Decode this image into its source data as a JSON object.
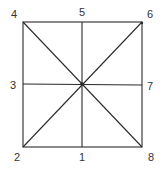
{
  "diagram": {
    "type": "square-with-diagonals-and-midlines",
    "colors": {
      "line": "#2a2a2a",
      "label": "#333333",
      "background": "#ffffff"
    },
    "square": {
      "x1": 23,
      "y1": 22,
      "x2": 142,
      "y2": 147
    },
    "center": {
      "x": 82,
      "y": 84
    },
    "labels": [
      {
        "id": "1",
        "text": "1",
        "x": 82,
        "y": 161,
        "position": "bottom-center"
      },
      {
        "id": "2",
        "text": "2",
        "x": 17,
        "y": 161,
        "position": "bottom-left"
      },
      {
        "id": "3",
        "text": "3",
        "x": 13,
        "y": 89,
        "position": "left-middle"
      },
      {
        "id": "4",
        "text": "4",
        "x": 14,
        "y": 18,
        "position": "top-left"
      },
      {
        "id": "5",
        "text": "5",
        "x": 82,
        "y": 16,
        "position": "top-center"
      },
      {
        "id": "6",
        "text": "6",
        "x": 150,
        "y": 18,
        "position": "top-right"
      },
      {
        "id": "7",
        "text": "7",
        "x": 150,
        "y": 90,
        "position": "right-middle"
      },
      {
        "id": "8",
        "text": "8",
        "x": 151,
        "y": 161,
        "position": "bottom-right"
      }
    ]
  }
}
